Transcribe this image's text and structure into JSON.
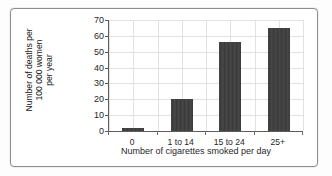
{
  "chart_data": {
    "type": "bar",
    "title": "",
    "categories": [
      "0",
      "1 to 14",
      "15 to 24",
      "25+"
    ],
    "values": [
      2,
      20.5,
      56,
      65
    ],
    "xlabel": "Number of cigarettes smoked per day",
    "ylabel": "Number of deaths per 100 000 women per year",
    "ylabel_lines": [
      "Number of deaths per",
      "100 000 women",
      "per year"
    ],
    "ylim": [
      0,
      70
    ],
    "yticks": [
      0,
      10,
      20,
      30,
      40,
      50,
      60,
      70
    ],
    "ytick_labels": [
      "0",
      "10",
      "20",
      "30",
      "40",
      "50",
      "60",
      "70"
    ],
    "grid": true,
    "legend": "none",
    "bar_color": "#3d3d3d",
    "grid_color": "#e2e2e2",
    "axis_color": "#5d5d5d",
    "background": "#ffffff"
  }
}
